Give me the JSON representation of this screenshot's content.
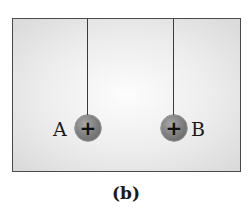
{
  "figure": {
    "caption": "(b)",
    "colors": {
      "frame_border": "#4a4a4a",
      "background_center": "#fdfdfd",
      "background_edge": "#d9d9d9",
      "sphere": "#828282",
      "string": "#3a3a3a",
      "text": "#1a1a1a"
    }
  },
  "spheres": [
    {
      "label": "A",
      "charge_symbol": "+",
      "charge": "positive",
      "label_side": "left"
    },
    {
      "label": "B",
      "charge_symbol": "+",
      "charge": "positive",
      "label_side": "right"
    }
  ]
}
